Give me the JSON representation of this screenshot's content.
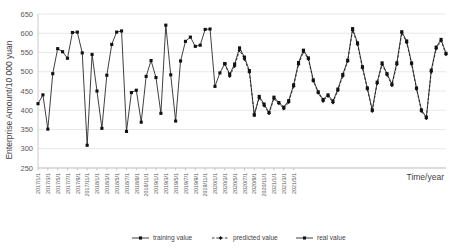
{
  "chart_data": {
    "type": "line",
    "title": "",
    "xlabel": "Time/year",
    "ylabel": "Enterprise Amount/10 000 yuan",
    "ylim": [
      250,
      650
    ],
    "ytick_step": 50,
    "yticks": [
      "250",
      "300",
      "350",
      "400",
      "450",
      "500",
      "550",
      "600",
      "650"
    ],
    "grid": true,
    "legend_position": "bottom",
    "x_tick_labels": [
      "2017/1/1",
      "2017/3/1",
      "2017/5/1",
      "2017/7/1",
      "2017/9/1",
      "2017/11/1",
      "2018/1/1",
      "2018/3/1",
      "2018/5/1",
      "2018/7/1",
      "2018/9/1",
      "2018/11/1",
      "2019/1/1",
      "2019/3/1",
      "2019/5/1",
      "2019/7/1",
      "2019/9/1",
      "2019/11/1",
      "2020/1/1",
      "2020/3/1",
      "2020/5/1",
      "2020/7/1",
      "2020/9/1",
      "2020/11/1",
      "2021/1/1",
      "2021/3/1",
      "2021/5/1"
    ],
    "x": [
      "2017/1/1",
      "2017/2/1",
      "2017/3/1",
      "2017/4/1",
      "2017/5/1",
      "2017/6/1",
      "2017/7/1",
      "2017/8/1",
      "2017/9/1",
      "2017/10/1",
      "2017/11/1",
      "2017/12/1",
      "2018/1/1",
      "2018/2/1",
      "2018/3/1",
      "2018/4/1",
      "2018/5/1",
      "2018/6/1",
      "2018/7/1",
      "2018/8/1",
      "2018/9/1",
      "2018/10/1",
      "2018/11/1",
      "2018/12/1",
      "2019/1/1",
      "2019/2/1",
      "2019/3/1",
      "2019/4/1",
      "2019/5/1",
      "2019/6/1",
      "2019/7/1",
      "2019/8/1",
      "2019/9/1",
      "2019/10/1",
      "2019/11/1",
      "2019/12/1",
      "2020/1/1",
      "2020/2/1",
      "2020/3/1",
      "2020/4/1",
      "2020/5/1",
      "2020/6/1",
      "2020/7/1",
      "2020/8/1",
      "2020/9/1",
      "2020/10/1",
      "2020/11/1",
      "2020/12/1",
      "2021/1/1",
      "2021/2/1",
      "2021/3/1",
      "2021/4/1",
      "2021/5/1"
    ],
    "series": [
      {
        "name": "training value",
        "marker": "square",
        "line": "solid",
        "start_index": 0,
        "values": [
          417,
          440,
          351,
          495,
          560,
          552,
          535,
          602,
          603,
          549,
          309,
          545,
          450,
          353,
          491,
          571,
          603,
          606,
          345,
          446,
          452,
          369,
          488,
          529,
          485,
          392,
          621,
          492,
          372,
          528,
          579,
          590,
          566,
          569,
          610,
          611,
          462,
          497,
          521,
          null,
          null,
          null,
          null,
          null,
          null,
          null,
          null,
          null,
          null,
          null,
          null,
          null,
          null
        ]
      },
      {
        "name": "predicted value",
        "marker": "diamond",
        "line": "dashed",
        "start_index": 38,
        "values": [
          null,
          null,
          null,
          null,
          null,
          null,
          null,
          null,
          null,
          null,
          null,
          null,
          null,
          null,
          null,
          null,
          null,
          null,
          null,
          null,
          null,
          null,
          null,
          null,
          null,
          null,
          null,
          null,
          null,
          null,
          null,
          null,
          null,
          null,
          null,
          null,
          null,
          null,
          521,
          489,
          515,
          556,
          533,
          499,
          390,
          432,
          412,
          392,
          430,
          418,
          404,
          421,
          462
        ]
      },
      {
        "name": "real value",
        "marker": "square",
        "line": "solid",
        "start_index": 38,
        "values": [
          null,
          null,
          null,
          null,
          null,
          null,
          null,
          null,
          null,
          null,
          null,
          null,
          null,
          null,
          null,
          null,
          null,
          null,
          null,
          null,
          null,
          null,
          null,
          null,
          null,
          null,
          null,
          null,
          null,
          null,
          null,
          null,
          null,
          null,
          null,
          null,
          null,
          null,
          521,
          494,
          520,
          562,
          538,
          503,
          387,
          436,
          416,
          394,
          434,
          420,
          408,
          425,
          466
        ]
      }
    ],
    "series_tail": {
      "note": "",
      "predicted_tail": [
        519,
        552,
        533,
        476,
        445,
        424,
        437,
        420,
        451,
        489,
        527,
        608,
        571,
        510,
        455,
        398,
        470,
        519,
        492,
        465,
        519,
        601,
        576,
        520,
        455,
        398,
        379,
        500,
        560,
        580,
        545
      ],
      "real_tail": [
        524,
        556,
        536,
        479,
        448,
        428,
        440,
        424,
        455,
        493,
        530,
        612,
        575,
        513,
        458,
        401,
        473,
        523,
        495,
        468,
        523,
        604,
        580,
        523,
        458,
        401,
        382,
        504,
        564,
        584,
        548
      ]
    }
  },
  "legend": {
    "items": [
      {
        "label": "training value"
      },
      {
        "label": "predicted value"
      },
      {
        "label": "real value"
      }
    ]
  }
}
